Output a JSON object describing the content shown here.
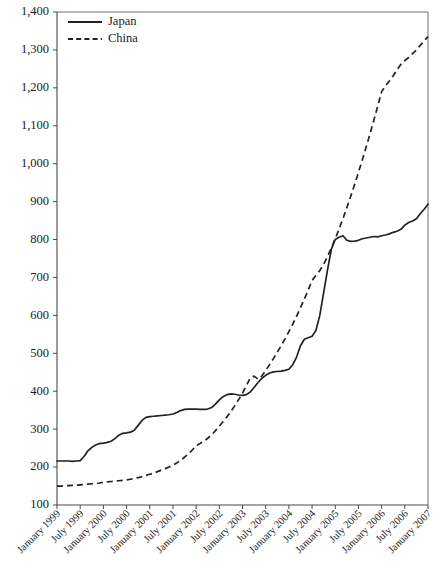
{
  "chart_data": {
    "type": "line",
    "title": "",
    "subtitle": "",
    "xlabel": "",
    "ylabel": "",
    "ylim": [
      100,
      1400
    ],
    "ytick_labels": [
      "100",
      "200",
      "300",
      "400",
      "500",
      "600",
      "700",
      "800",
      "900",
      "1,000",
      "1,100",
      "1,200",
      "1,300",
      "1,400"
    ],
    "ytick_values": [
      100,
      200,
      300,
      400,
      500,
      600,
      700,
      800,
      900,
      1000,
      1100,
      1200,
      1300,
      1400
    ],
    "grid": false,
    "legend_position": "top-left",
    "x_tick_labels": [
      "January 1999",
      "July 1999",
      "January 2000",
      "July 2000",
      "January 2001",
      "July 2001",
      "January 2002",
      "July 2002",
      "January 2003",
      "July 2003",
      "January 2004",
      "July 2004",
      "January 2005",
      "July 2005",
      "January 2006",
      "July 2006",
      "January 2007"
    ],
    "x_index_range": [
      0,
      96
    ],
    "x_tick_indices": [
      0,
      6,
      12,
      18,
      24,
      30,
      36,
      42,
      48,
      54,
      60,
      66,
      72,
      78,
      84,
      90,
      96
    ],
    "series": [
      {
        "name": "Japan",
        "style": "solid",
        "color": "#222222",
        "x": [
          0,
          1,
          2,
          3,
          4,
          5,
          6,
          7,
          8,
          9,
          10,
          11,
          12,
          13,
          14,
          15,
          16,
          17,
          18,
          19,
          20,
          21,
          22,
          23,
          24,
          25,
          26,
          27,
          28,
          29,
          30,
          31,
          32,
          33,
          34,
          35,
          36,
          37,
          38,
          39,
          40,
          41,
          42,
          43,
          44,
          45,
          46,
          47,
          48,
          49,
          50,
          51,
          52,
          53,
          54,
          55,
          56,
          57,
          58,
          59,
          60,
          61,
          62,
          63,
          64,
          65,
          66,
          67,
          68,
          69,
          70,
          71,
          72,
          73,
          74,
          75,
          76,
          77,
          78,
          79,
          80,
          81,
          82,
          83,
          84,
          85,
          86,
          87,
          88,
          89,
          90,
          91,
          92,
          93,
          94,
          95,
          96
        ],
        "values": [
          216,
          216,
          216,
          216,
          215,
          216,
          217,
          228,
          243,
          252,
          258,
          262,
          263,
          265,
          268,
          275,
          284,
          289,
          290,
          292,
          297,
          310,
          323,
          331,
          333,
          334,
          335,
          336,
          337,
          338,
          340,
          344,
          349,
          352,
          353,
          353,
          353,
          352,
          352,
          353,
          357,
          366,
          377,
          386,
          391,
          393,
          392,
          390,
          389,
          391,
          398,
          410,
          423,
          434,
          442,
          448,
          451,
          452,
          453,
          455,
          458,
          470,
          490,
          520,
          537,
          541,
          545,
          560,
          600,
          660,
          720,
          775,
          800,
          806,
          810,
          798,
          795,
          796,
          798,
          802,
          804,
          806,
          808,
          807,
          810,
          812,
          815,
          819,
          822,
          827,
          838,
          845,
          849,
          855,
          868,
          880,
          893
        ]
      },
      {
        "name": "China",
        "style": "dashed",
        "color": "#222222",
        "x": [
          0,
          1,
          2,
          3,
          4,
          5,
          6,
          7,
          8,
          9,
          10,
          11,
          12,
          13,
          14,
          15,
          16,
          17,
          18,
          19,
          20,
          21,
          22,
          23,
          24,
          25,
          26,
          27,
          28,
          29,
          30,
          31,
          32,
          33,
          34,
          35,
          36,
          37,
          38,
          39,
          40,
          41,
          42,
          43,
          44,
          45,
          46,
          47,
          48,
          49,
          50,
          51,
          52,
          53,
          54,
          55,
          56,
          57,
          58,
          59,
          60,
          61,
          62,
          63,
          64,
          65,
          66,
          67,
          68,
          69,
          70,
          71,
          72,
          73,
          74,
          75,
          76,
          77,
          78,
          79,
          80,
          81,
          82,
          83,
          84,
          85,
          86,
          87,
          88,
          89,
          90,
          91,
          92,
          93,
          94,
          95,
          96
        ],
        "values": [
          150,
          150,
          151,
          151,
          152,
          152,
          153,
          154,
          155,
          156,
          157,
          158,
          160,
          161,
          162,
          163,
          164,
          165,
          166,
          168,
          170,
          172,
          175,
          178,
          181,
          184,
          188,
          192,
          196,
          200,
          205,
          211,
          218,
          226,
          235,
          245,
          256,
          262,
          268,
          276,
          285,
          296,
          308,
          320,
          333,
          347,
          362,
          378,
          395,
          415,
          435,
          440,
          432,
          440,
          455,
          470,
          486,
          503,
          520,
          538,
          557,
          577,
          598,
          620,
          643,
          667,
          692,
          705,
          718,
          735,
          755,
          778,
          802,
          828,
          855,
          884,
          914,
          945,
          977,
          1010,
          1044,
          1079,
          1115,
          1152,
          1190,
          1205,
          1218,
          1232,
          1248,
          1262,
          1272,
          1280,
          1290,
          1300,
          1312,
          1324,
          1335
        ]
      }
    ],
    "legend": [
      {
        "label": "Japan",
        "style": "solid"
      },
      {
        "label": "China",
        "style": "dashed"
      }
    ]
  },
  "plot_geometry": {
    "left": 57,
    "right": 428,
    "top": 12,
    "bottom": 505
  }
}
